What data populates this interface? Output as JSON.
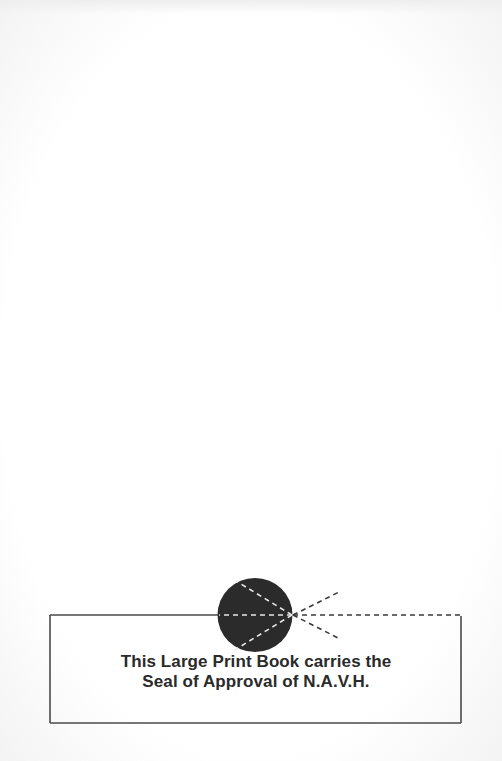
{
  "page": {
    "type": "large-print-book-notice-page",
    "seal": {
      "description": "N.A.V.H. seal: dark circle with dashed rays emanating from a point",
      "colors": {
        "circle": "#2b2b2b",
        "rays_inside": "#e6e6e6",
        "rays_outside": "#3a3a3a",
        "frame": "#444444"
      }
    },
    "notice": {
      "line1": "This Large Print Book carries the",
      "line2": "Seal of Approval of N.A.V.H."
    }
  }
}
